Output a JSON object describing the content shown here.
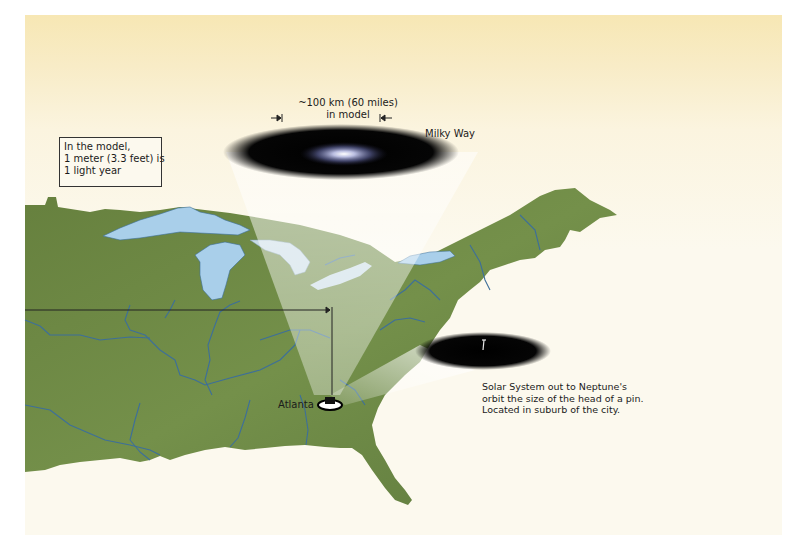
{
  "figure": {
    "scale_label": {
      "line1": "~100 km (60 miles)",
      "line2": "in model"
    },
    "galaxy_label": "Milky Way",
    "note": {
      "lines": [
        "In the model,",
        "1 meter (3.3 feet) is",
        "1 light year"
      ]
    },
    "city_label": "Atlanta",
    "solar_caption": {
      "lines": [
        "Solar System out to Neptune's",
        "orbit the size of the head of a pin.",
        "Located in suburb of the city."
      ]
    },
    "colors": {
      "background_top": "#f7e7b4",
      "background": "#fcf9ee",
      "land": "#6f8a44",
      "water": "#a9cfea",
      "rivers": "#3d6f9a",
      "disk": "#000000",
      "beam": "#e6e4dc"
    }
  }
}
